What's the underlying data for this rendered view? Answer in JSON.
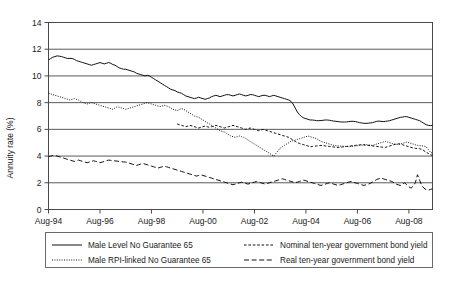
{
  "chart_data": {
    "type": "line",
    "title": "",
    "xlabel": "",
    "ylabel": "Annuity rate (%)",
    "ylim": [
      0,
      14
    ],
    "yticks": [
      0,
      2,
      4,
      6,
      8,
      10,
      12,
      14
    ],
    "ytick_labels": [
      "0",
      "2",
      "4",
      "6",
      "8",
      "10",
      "12",
      "14"
    ],
    "grid": true,
    "grid_axis": "y",
    "legend_position": "bottom",
    "x_start": "Aug-94",
    "x_end": "Dec-08",
    "x_interval_months": 1,
    "xtick_labels": [
      "Aug-94",
      "Aug-96",
      "Aug-98",
      "Aug-00",
      "Aug-02",
      "Aug-04",
      "Aug-06",
      "Aug-08"
    ],
    "xtick_interval_months": 24,
    "series": [
      {
        "name": "Male Level No Guarantee 65",
        "style": "solid",
        "color": "#111111",
        "values": [
          11.2,
          11.3,
          11.4,
          11.45,
          11.5,
          11.48,
          11.45,
          11.4,
          11.35,
          11.3,
          11.32,
          11.3,
          11.25,
          11.15,
          11.1,
          11.05,
          11.0,
          10.95,
          10.9,
          10.85,
          10.8,
          10.85,
          10.9,
          10.95,
          11.0,
          10.95,
          10.9,
          10.95,
          11.0,
          10.95,
          10.85,
          10.8,
          10.7,
          10.6,
          10.55,
          10.5,
          10.5,
          10.45,
          10.4,
          10.35,
          10.3,
          10.2,
          10.15,
          10.1,
          10.05,
          10.0,
          10.05,
          10.0,
          9.9,
          9.8,
          9.7,
          9.6,
          9.5,
          9.4,
          9.3,
          9.2,
          9.1,
          9.0,
          8.95,
          8.9,
          8.8,
          8.75,
          8.7,
          8.6,
          8.5,
          8.45,
          8.4,
          8.35,
          8.3,
          8.35,
          8.4,
          8.35,
          8.3,
          8.25,
          8.3,
          8.35,
          8.45,
          8.5,
          8.55,
          8.5,
          8.45,
          8.5,
          8.55,
          8.6,
          8.6,
          8.55,
          8.5,
          8.55,
          8.6,
          8.65,
          8.6,
          8.55,
          8.5,
          8.55,
          8.6,
          8.6,
          8.55,
          8.5,
          8.45,
          8.5,
          8.55,
          8.55,
          8.5,
          8.45,
          8.5,
          8.55,
          8.5,
          8.45,
          8.4,
          8.35,
          8.3,
          8.25,
          8.2,
          8.1,
          7.9,
          7.6,
          7.3,
          7.1,
          6.95,
          6.85,
          6.8,
          6.75,
          6.7,
          6.7,
          6.68,
          6.65,
          6.65,
          6.66,
          6.68,
          6.7,
          6.7,
          6.68,
          6.65,
          6.62,
          6.6,
          6.58,
          6.56,
          6.55,
          6.55,
          6.56,
          6.58,
          6.6,
          6.6,
          6.58,
          6.55,
          6.5,
          6.48,
          6.45,
          6.45,
          6.46,
          6.48,
          6.5,
          6.55,
          6.6,
          6.62,
          6.6,
          6.58,
          6.6,
          6.62,
          6.65,
          6.7,
          6.75,
          6.8,
          6.85,
          6.9,
          6.92,
          6.95,
          6.95,
          6.9,
          6.85,
          6.8,
          6.75,
          6.7,
          6.65,
          6.55,
          6.45,
          6.35,
          6.3,
          6.28,
          6.3
        ]
      },
      {
        "name": "Male RPI-linked No Guarantee 65",
        "style": "dotted",
        "color": "#111111",
        "values": [
          8.7,
          8.65,
          8.6,
          8.55,
          8.5,
          8.45,
          8.4,
          8.35,
          8.3,
          8.25,
          8.2,
          8.25,
          8.3,
          8.25,
          8.2,
          8.1,
          8.0,
          7.95,
          7.9,
          7.95,
          8.0,
          7.95,
          7.9,
          7.85,
          7.8,
          7.75,
          7.7,
          7.65,
          7.6,
          7.55,
          7.5,
          7.6,
          7.7,
          7.65,
          7.6,
          7.55,
          7.5,
          7.55,
          7.6,
          7.65,
          7.7,
          7.75,
          7.8,
          7.85,
          7.9,
          7.95,
          8.0,
          7.95,
          7.9,
          7.85,
          7.8,
          7.75,
          7.7,
          7.75,
          7.8,
          7.75,
          7.7,
          7.6,
          7.5,
          7.45,
          7.4,
          7.5,
          7.55,
          7.5,
          7.4,
          7.3,
          7.2,
          7.1,
          7.0,
          6.95,
          6.9,
          6.8,
          6.7,
          6.6,
          6.5,
          6.4,
          6.3,
          6.2,
          6.1,
          6.0,
          5.9,
          5.85,
          5.8,
          5.7,
          5.6,
          5.5,
          5.45,
          5.4,
          5.45,
          5.5,
          5.45,
          5.4,
          5.3,
          5.2,
          5.1,
          5.0,
          4.9,
          4.8,
          4.7,
          4.6,
          4.5,
          4.4,
          4.3,
          4.2,
          4.1,
          4.0,
          4.2,
          4.4,
          4.6,
          4.7,
          4.8,
          4.9,
          5.0,
          5.1,
          5.15,
          5.2,
          5.25,
          5.3,
          5.35,
          5.4,
          5.45,
          5.5,
          5.45,
          5.4,
          5.35,
          5.3,
          5.2,
          5.1,
          5.05,
          5.0,
          4.95,
          4.9,
          4.85,
          4.8,
          4.78,
          4.76,
          4.75,
          4.74,
          4.73,
          4.72,
          4.7,
          4.72,
          4.74,
          4.76,
          4.78,
          4.8,
          4.82,
          4.84,
          4.85,
          4.84,
          4.82,
          4.8,
          4.85,
          4.9,
          4.95,
          5.0,
          5.05,
          5.1,
          5.05,
          5.0,
          4.95,
          4.9,
          4.88,
          4.86,
          4.9,
          4.95,
          5.0,
          5.05,
          5.0,
          4.95,
          4.9,
          4.85,
          4.8,
          4.78,
          4.76,
          4.75,
          4.7,
          4.5,
          4.3,
          4.2
        ]
      },
      {
        "name": "Nominal ten-year government bond yield",
        "style": "short-dash",
        "color": "#111111",
        "values": [
          null,
          null,
          null,
          null,
          null,
          null,
          null,
          null,
          null,
          null,
          null,
          null,
          null,
          null,
          null,
          null,
          null,
          null,
          null,
          null,
          null,
          null,
          null,
          null,
          null,
          null,
          null,
          null,
          null,
          null,
          null,
          null,
          null,
          null,
          null,
          null,
          null,
          null,
          null,
          null,
          null,
          null,
          null,
          null,
          null,
          null,
          null,
          null,
          null,
          null,
          null,
          null,
          null,
          null,
          null,
          null,
          null,
          null,
          null,
          null,
          6.4,
          6.35,
          6.3,
          6.25,
          6.2,
          6.25,
          6.3,
          6.25,
          6.2,
          6.15,
          6.1,
          6.15,
          6.2,
          6.25,
          6.2,
          6.15,
          6.2,
          6.25,
          6.3,
          6.25,
          6.2,
          6.15,
          6.1,
          6.15,
          6.2,
          6.25,
          6.3,
          6.25,
          6.2,
          6.15,
          6.1,
          6.05,
          6.0,
          6.05,
          6.1,
          6.05,
          6.0,
          5.95,
          5.9,
          5.95,
          6.0,
          5.95,
          5.9,
          5.85,
          5.8,
          5.75,
          5.7,
          5.65,
          5.6,
          5.55,
          5.5,
          5.45,
          5.4,
          5.3,
          5.2,
          5.1,
          5.0,
          4.95,
          4.9,
          4.85,
          4.8,
          4.75,
          4.7,
          4.72,
          4.74,
          4.76,
          4.78,
          4.8,
          4.78,
          4.76,
          4.74,
          4.72,
          4.7,
          4.68,
          4.66,
          4.65,
          4.66,
          4.68,
          4.7,
          4.72,
          4.74,
          4.76,
          4.78,
          4.8,
          4.82,
          4.84,
          4.85,
          4.84,
          4.82,
          4.8,
          4.78,
          4.76,
          4.74,
          4.72,
          4.7,
          4.68,
          4.66,
          4.65,
          4.7,
          4.75,
          4.8,
          4.85,
          4.9,
          4.92,
          4.9,
          4.85,
          4.8,
          4.75,
          4.7,
          4.65,
          4.6,
          4.58,
          4.56,
          4.55,
          4.5,
          4.4,
          4.3,
          4.2,
          4.1,
          4.05
        ]
      },
      {
        "name": "Real ten-year government bond yield",
        "style": "long-dash",
        "color": "#111111",
        "values": [
          3.95,
          4.0,
          4.05,
          4.05,
          4.0,
          3.95,
          3.9,
          3.85,
          3.8,
          3.75,
          3.7,
          3.65,
          3.6,
          3.65,
          3.7,
          3.65,
          3.6,
          3.55,
          3.5,
          3.55,
          3.6,
          3.65,
          3.6,
          3.55,
          3.5,
          3.55,
          3.6,
          3.65,
          3.7,
          3.68,
          3.66,
          3.64,
          3.62,
          3.6,
          3.58,
          3.56,
          3.55,
          3.5,
          3.45,
          3.4,
          3.35,
          3.3,
          3.35,
          3.4,
          3.45,
          3.4,
          3.35,
          3.3,
          3.25,
          3.2,
          3.15,
          3.1,
          3.15,
          3.2,
          3.25,
          3.2,
          3.15,
          3.1,
          3.05,
          3.0,
          2.95,
          2.9,
          2.85,
          2.8,
          2.75,
          2.7,
          2.65,
          2.6,
          2.55,
          2.5,
          2.55,
          2.6,
          2.55,
          2.5,
          2.45,
          2.4,
          2.35,
          2.3,
          2.25,
          2.2,
          2.15,
          2.1,
          2.05,
          2.0,
          1.95,
          1.9,
          1.85,
          1.9,
          1.95,
          2.0,
          2.05,
          2.0,
          1.95,
          1.9,
          1.95,
          2.0,
          2.05,
          2.1,
          2.05,
          2.0,
          1.95,
          1.9,
          1.95,
          2.0,
          2.05,
          2.1,
          2.15,
          2.2,
          2.25,
          2.3,
          2.25,
          2.2,
          2.15,
          2.1,
          2.05,
          2.0,
          2.05,
          2.1,
          2.15,
          2.2,
          2.15,
          2.1,
          2.05,
          2.0,
          1.95,
          1.9,
          1.85,
          1.8,
          1.85,
          1.9,
          1.95,
          2.0,
          1.95,
          1.9,
          1.85,
          1.8,
          1.85,
          1.9,
          1.95,
          2.0,
          2.05,
          2.1,
          2.05,
          2.0,
          1.95,
          1.9,
          1.85,
          1.8,
          1.85,
          1.9,
          1.95,
          2.05,
          2.15,
          2.25,
          2.3,
          2.35,
          2.3,
          2.25,
          2.2,
          2.15,
          2.1,
          2.0,
          1.9,
          1.85,
          1.8,
          1.9,
          2.0,
          1.85,
          1.7,
          1.6,
          1.75,
          2.0,
          2.6,
          2.2,
          1.8,
          1.6,
          1.5,
          1.45,
          1.5,
          1.55
        ]
      }
    ]
  },
  "legend": {
    "entries": [
      {
        "label": "Male Level No Guarantee 65",
        "style": "solid"
      },
      {
        "label": "Nominal ten-year government bond yield",
        "style": "short-dash"
      },
      {
        "label": "Male RPI-linked No Guarantee 65",
        "style": "dotted"
      },
      {
        "label": "Real ten-year government bond yield",
        "style": "long-dash"
      }
    ]
  }
}
